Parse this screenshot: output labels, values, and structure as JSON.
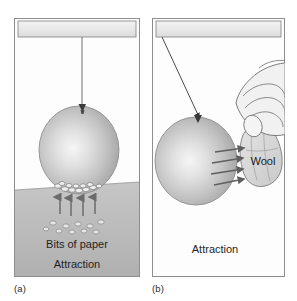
{
  "figure": {
    "kind": "physics-illustration",
    "background_color": "#ffffff"
  },
  "panels": [
    {
      "id": "a",
      "caption": "(a)",
      "labels": {
        "ground_label": "Bits of paper",
        "effect_label": "Attraction"
      },
      "objects": {
        "ceiling_bar": "support-bar",
        "string": "vertical-string",
        "balloon": "balloon",
        "knot": "balloon-knot",
        "floor": "floor-plane",
        "paper_bits": "bits-of-paper",
        "force_arrows": "upward-attraction-arrows",
        "arrow_count": 4
      }
    },
    {
      "id": "b",
      "caption": "(b)",
      "labels": {
        "material_label": "Wool",
        "effect_label": "Attraction"
      },
      "objects": {
        "ceiling_bar": "support-bar",
        "string": "angled-string",
        "balloon": "balloon",
        "knot": "balloon-knot",
        "hand": "hand-holding-cloth",
        "cloth": "wool-cloth",
        "force_arrows": "rightward-attraction-arrows",
        "arrow_count": 4
      }
    }
  ],
  "colors": {
    "panel_border": "#8d8d8d",
    "panel_fill": "#fdfdfd",
    "ceiling_fill": "#ebebeb",
    "ceiling_border": "#8d8d8d",
    "string": "#6e6e6e",
    "balloon_light": "#f2f2f2",
    "balloon_mid": "#c8c8c8",
    "balloon_dark": "#9a9a9a",
    "balloon_outline": "#8a8a8a",
    "floor_fill": "#b9b9b9",
    "floor_line": "#8f8f8f",
    "arrow": "#6b6b6b",
    "paper_bit": "#e9e9e9",
    "paper_bit_outline": "#7e7e7e",
    "cloth_fill": "#d6d6d6",
    "hand_fill": "#f0f0f0",
    "ink": "#2b2b2b",
    "knot": "#3a3a3a"
  },
  "text_sizes": {
    "label": "11px",
    "caption": "9.5px"
  }
}
